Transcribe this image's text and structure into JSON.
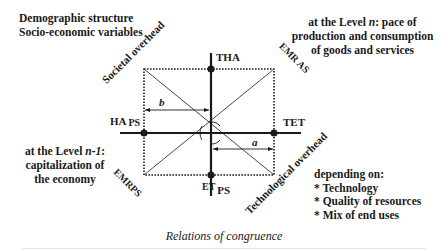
{
  "top_left": {
    "line1": "Demographic structure",
    "line2": "Socio-economic variables"
  },
  "top_right": {
    "line1": "at the Level ",
    "line1_italic": "n",
    "line1_end": ": pace of",
    "line2": "production and consumption",
    "line3": "of goods and services"
  },
  "bottom_left": {
    "line1": "at the Level ",
    "line1_italic": "n-1",
    "line1_end": ":",
    "line2": "capitalization of",
    "line3": "the economy"
  },
  "bottom_right": {
    "heading": "depending on:",
    "items": [
      "* Technology",
      "* Quality of resources",
      "* Mix of end uses"
    ]
  },
  "diagonal_labels": {
    "societal_overhead": "Societal overhead",
    "technological_overhead": "Technological overhead",
    "emr_as": "EMR AS",
    "emr_ps": "EMRPS"
  },
  "axis_labels": {
    "tha": "THA",
    "tet": "TET",
    "ha": "HA",
    "ha_sub": "PS",
    "et": "ET",
    "et_sub": "PS"
  },
  "segment_labels": {
    "a": "a",
    "b": "b"
  },
  "caption": "Relations of congruence",
  "colors": {
    "ink": "#1a1a1a",
    "background": "#ffffff"
  }
}
